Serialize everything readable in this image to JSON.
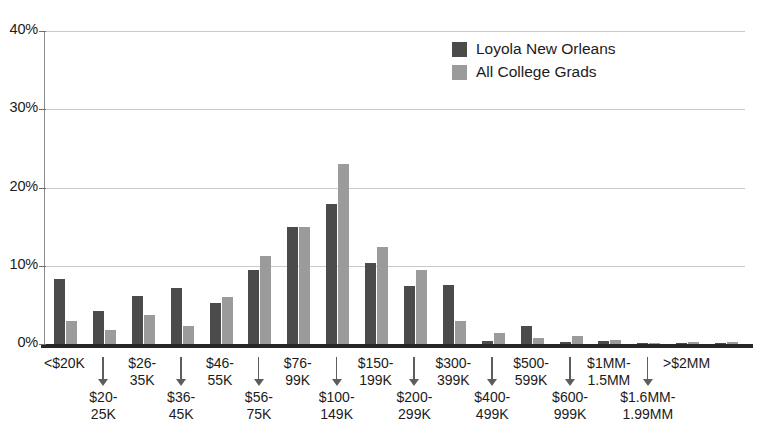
{
  "chart_data": {
    "type": "bar",
    "title": "",
    "subtitle": "",
    "xlabel": "",
    "ylabel": "",
    "ylim": [
      0,
      40
    ],
    "y_ticks": [
      "0%",
      "10%",
      "20%",
      "30%",
      "40%"
    ],
    "y_tick_values": [
      0,
      10,
      20,
      30,
      40
    ],
    "grid": true,
    "legend_position": "top-right",
    "categories": [
      "<$20K",
      "$20-25K",
      "$26-35K",
      "$36-45K",
      "$46-55K",
      "$56-75K",
      "$76-99K",
      "$100-149K",
      "$150-199K",
      "$200-299K",
      "$300-399K",
      "$400-499K",
      "$500-599K",
      "$600-999K",
      "$1MM-1.5MM",
      "$1.6MM-1.99MM",
      ">$2MM",
      ""
    ],
    "category_labels_display": [
      {
        "line1": "<$20K",
        "line2": "",
        "row": "top"
      },
      {
        "line1": "$20-",
        "line2": "25K",
        "row": "bottom"
      },
      {
        "line1": "$26-",
        "line2": "35K",
        "row": "top"
      },
      {
        "line1": "$36-",
        "line2": "45K",
        "row": "bottom"
      },
      {
        "line1": "$46-",
        "line2": "55K",
        "row": "top"
      },
      {
        "line1": "$56-",
        "line2": "75K",
        "row": "bottom"
      },
      {
        "line1": "$76-",
        "line2": "99K",
        "row": "top"
      },
      {
        "line1": "$100-",
        "line2": "149K",
        "row": "bottom"
      },
      {
        "line1": "$150-",
        "line2": "199K",
        "row": "top"
      },
      {
        "line1": "$200-",
        "line2": "299K",
        "row": "bottom"
      },
      {
        "line1": "$300-",
        "line2": "399K",
        "row": "top"
      },
      {
        "line1": "$400-",
        "line2": "499K",
        "row": "bottom"
      },
      {
        "line1": "$500-",
        "line2": "599K",
        "row": "top"
      },
      {
        "line1": "$600-",
        "line2": "999K",
        "row": "bottom"
      },
      {
        "line1": "$1MM-",
        "line2": "1.5MM",
        "row": "top"
      },
      {
        "line1": "$1.6MM-",
        "line2": "1.99MM",
        "row": "bottom"
      },
      {
        "line1": ">$2MM",
        "line2": "",
        "row": "top"
      }
    ],
    "series": [
      {
        "name": "Loyola New Orleans",
        "color": "#4b4b4b",
        "values": [
          8.3,
          4.2,
          6.2,
          7.2,
          5.2,
          9.4,
          14.9,
          17.9,
          10.4,
          7.4,
          7.5,
          0.4,
          2.3,
          0.2,
          0.4,
          0.1,
          0.1,
          0.1
        ]
      },
      {
        "name": "All College Grads",
        "color": "#9b9b9b",
        "values": [
          3.0,
          1.8,
          3.7,
          2.3,
          6.0,
          11.2,
          14.9,
          23.0,
          12.4,
          9.5,
          2.9,
          1.4,
          0.8,
          1.0,
          0.5,
          0.1,
          0.3,
          0.2
        ]
      }
    ]
  },
  "legend": {
    "items": [
      {
        "label": "Loyola New Orleans",
        "color": "#4b4b4b"
      },
      {
        "label": "All College Grads",
        "color": "#9b9b9b"
      }
    ]
  },
  "colors": {
    "series_dark": "#4b4b4b",
    "series_light": "#9b9b9b",
    "gridline": "#c9c9c9",
    "axis": "#272727",
    "text": "#1b1b1b"
  }
}
